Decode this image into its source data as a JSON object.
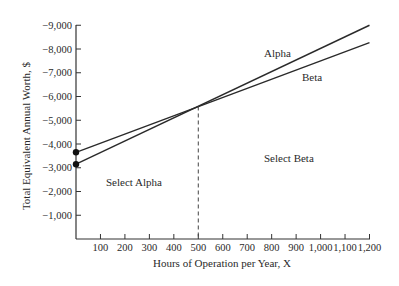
{
  "chart_data": {
    "type": "line",
    "title": "",
    "xlabel": "Hours of Operation per Year, X",
    "ylabel": "Total Equivalent Annual Worth, $",
    "xlim": [
      0,
      1200
    ],
    "ylim": [
      0,
      -9000
    ],
    "x_ticks": [
      100,
      200,
      300,
      400,
      500,
      600,
      700,
      800,
      900,
      1000,
      1100,
      1200
    ],
    "x_tick_labels": [
      "100",
      "200",
      "300",
      "400",
      "500",
      "600",
      "700",
      "800",
      "900",
      "1,000",
      "1,100",
      "1,200"
    ],
    "y_ticks": [
      -1000,
      -2000,
      -3000,
      -4000,
      -5000,
      -6000,
      -7000,
      -8000,
      -9000
    ],
    "y_tick_labels": [
      "-1,000",
      "-2,000",
      "-3,000",
      "-4,000",
      "-5,000",
      "-6,000",
      "-7,000",
      "-8,000",
      "-9,000"
    ],
    "grid": false,
    "legend": "inline labels",
    "series": [
      {
        "name": "Alpha",
        "x": [
          0,
          1200
        ],
        "values": [
          -3150,
          -9000
        ],
        "start_marker": true
      },
      {
        "name": "Beta",
        "x": [
          0,
          1200
        ],
        "values": [
          -3650,
          -8270
        ],
        "start_marker": true
      }
    ],
    "breakeven": {
      "x": 500,
      "y": -5580,
      "style": "dashed vertical"
    },
    "annotations": [
      {
        "text": "Select Alpha",
        "region": "x < 500"
      },
      {
        "text": "Select Beta",
        "region": "x > 500"
      },
      {
        "text": "Alpha",
        "target": "upper line at right"
      },
      {
        "text": "Beta",
        "target": "lower line at right"
      }
    ]
  },
  "labels": {
    "xlabel": "Hours of Operation per Year, X",
    "ylabel": "Total Equivalent Annual Worth, $",
    "alpha": "Alpha",
    "beta": "Beta",
    "select_alpha": "Select Alpha",
    "select_beta": "Select Beta"
  }
}
